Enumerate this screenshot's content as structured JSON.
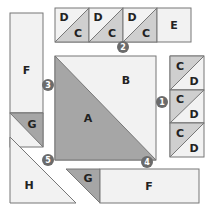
{
  "colors": {
    "light": "#f2f2f2",
    "dark": "#a6a6a6",
    "mid": "#cfcfcf",
    "stroke": "#777777",
    "badge": "#6b6b6b"
  },
  "pieces": {
    "top_row": [
      {
        "top": "D",
        "bottom": "C"
      },
      {
        "top": "D",
        "bottom": "C"
      },
      {
        "top": "D",
        "bottom": "C"
      }
    ],
    "top_row_end": "E",
    "right_column": [
      {
        "top": "C",
        "bottom": "D"
      },
      {
        "top": "C",
        "bottom": "D"
      },
      {
        "top": "C",
        "bottom": "D"
      }
    ],
    "big_square_dark": "A",
    "big_square_light": "B",
    "left_rect": "F",
    "left_triangle": "G",
    "corner_triangle": "H",
    "bottom_triangle": "G",
    "bottom_rect": "F"
  },
  "badges": {
    "one": "1",
    "two": "2",
    "three": "3",
    "four": "4",
    "five": "5"
  }
}
